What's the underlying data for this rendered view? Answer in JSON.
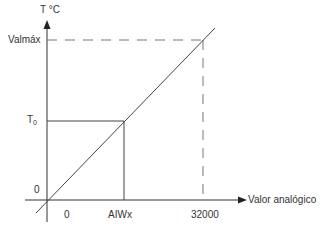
{
  "diagram": {
    "y_axis_label": "T °C",
    "x_axis_label": "Valor analógico",
    "y_ticks": {
      "max": "Valmáx",
      "t0_main": "T",
      "t0_sub": "0",
      "zero": "0"
    },
    "x_ticks": {
      "zero": "0",
      "aiwx": "AIWx",
      "max": "32000"
    },
    "colors": {
      "line": "#555555",
      "dashed": "#777777",
      "text": "#333333"
    }
  }
}
